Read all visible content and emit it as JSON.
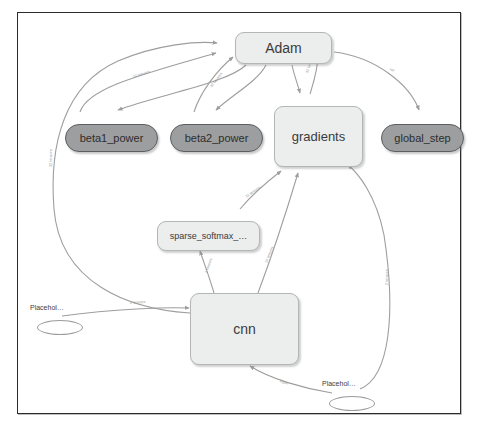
{
  "graph": {
    "title": "TensorFlow computation graph",
    "background_color": "#ffffff",
    "frame_color": "#2b2b2b",
    "group_node_fill": "#eceded",
    "group_node_stroke": "#b3b5b6",
    "op_node_fill": "#9d9e9f",
    "op_node_stroke": "#5d5f60",
    "edge_color": "#9e9e9e",
    "edge_label_color": "#8c8c8c"
  },
  "nodes": [
    {
      "id": "adam",
      "label": "Adam",
      "type": "group",
      "x": 217,
      "y": 19,
      "w": 97,
      "h": 32,
      "font_size": 14
    },
    {
      "id": "beta1_power",
      "label": "beta1_power",
      "type": "op",
      "x": 47,
      "y": 111,
      "w": 93,
      "h": 28,
      "font_size": 11
    },
    {
      "id": "beta2_power",
      "label": "beta2_power",
      "type": "op",
      "x": 152,
      "y": 111,
      "w": 93,
      "h": 28,
      "font_size": 11
    },
    {
      "id": "gradients",
      "label": "gradients",
      "type": "group",
      "x": 256,
      "y": 93,
      "w": 89,
      "h": 61,
      "font_size": 13
    },
    {
      "id": "global_step",
      "label": "global_step",
      "type": "op",
      "x": 363,
      "y": 111,
      "w": 83,
      "h": 28,
      "font_size": 11
    },
    {
      "id": "sparse_softmax",
      "label": "sparse_softmax_…",
      "type": "group",
      "x": 139,
      "y": 208,
      "w": 103,
      "h": 30,
      "font_size": 9
    },
    {
      "id": "cnn",
      "label": "cnn",
      "type": "group",
      "x": 172,
      "y": 280,
      "w": 109,
      "h": 72,
      "font_size": 14
    },
    {
      "id": "placeholder_1",
      "label": "Placehol…",
      "type": "placeholder",
      "x": 19,
      "y": 301,
      "w": 46,
      "h": 15,
      "font_size": 7
    },
    {
      "id": "placeholder_2",
      "label": "Placehol…",
      "type": "placeholder",
      "x": 311,
      "y": 377,
      "w": 46,
      "h": 15,
      "font_size": 7
    }
  ],
  "edges": [
    {
      "id": "e1",
      "from": "beta1_power",
      "to": "adam",
      "label": "32 tensors"
    },
    {
      "id": "e2",
      "from": "beta2_power",
      "to": "adam",
      "label": "32 tensors"
    },
    {
      "id": "e3",
      "from": "gradients",
      "to": "adam",
      "label": "32 tensors"
    },
    {
      "id": "e4",
      "from": "adam",
      "to": "global_step",
      "label": "ref"
    },
    {
      "id": "e5",
      "from": "adam",
      "to": "beta1_power",
      "label": ""
    },
    {
      "id": "e6",
      "from": "adam",
      "to": "beta2_power",
      "label": ""
    },
    {
      "id": "e7",
      "from": "adam",
      "to": "gradients",
      "label": ""
    },
    {
      "id": "e8",
      "from": "cnn",
      "to": "adam",
      "label": "32 tensors"
    },
    {
      "id": "e9",
      "from": "sparse_softmax",
      "to": "gradients",
      "label": "11 tensors"
    },
    {
      "id": "e10",
      "from": "cnn",
      "to": "sparse_softmax",
      "label": "2 tensors"
    },
    {
      "id": "e11",
      "from": "cnn",
      "to": "gradients",
      "label": "12 tensors"
    },
    {
      "id": "e12",
      "from": "placeholder_1",
      "to": "cnn",
      "label": "2 tensors"
    },
    {
      "id": "e13",
      "from": "placeholder_2",
      "to": "cnn",
      "label": "input"
    },
    {
      "id": "e14",
      "from": "placeholder_2",
      "to": "gradients",
      "label": "2 tensors"
    }
  ]
}
